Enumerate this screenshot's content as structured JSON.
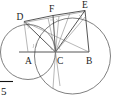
{
  "figure": {
    "kind": "geometry-diagram",
    "background_color": "#ffffff",
    "line_color": "#2b2b2b",
    "circle_color": "#555555",
    "label_color": "#1a1a1a",
    "points": [
      {
        "id": "A",
        "label": "A",
        "x": 28,
        "y": 52,
        "label_x": 25,
        "label_y": 64
      },
      {
        "id": "B",
        "label": "B",
        "x": 89,
        "y": 52,
        "label_x": 86,
        "label_y": 64
      },
      {
        "id": "C",
        "label": "C",
        "x": 55.5,
        "y": 52,
        "label_x": 57,
        "label_y": 64
      },
      {
        "id": "D",
        "label": "D",
        "x": 24,
        "y": 21.5,
        "label_x": 17,
        "label_y": 20
      },
      {
        "id": "E",
        "label": "E",
        "x": 85,
        "y": 10.5,
        "label_x": 83,
        "label_y": 8
      },
      {
        "id": "F",
        "label": "F",
        "x": 53,
        "y": 15.5,
        "label_x": 49,
        "label_y": 12
      }
    ],
    "circles": [
      {
        "id": "circle-A",
        "center_label": "A",
        "cx": 28,
        "cy": 52,
        "r": 27.5
      },
      {
        "id": "circle-B",
        "center_label": "B",
        "cx": 72.5,
        "cy": 56,
        "r": 38
      }
    ],
    "segments": [
      {
        "id": "seg-AB",
        "from": "A",
        "to": "B"
      },
      {
        "id": "seg-AD",
        "from": "A",
        "to": "D"
      },
      {
        "id": "seg-DC",
        "from": "D",
        "to": "C"
      },
      {
        "id": "seg-DF",
        "from": "D",
        "to": "F"
      },
      {
        "id": "seg-DE",
        "from": "D",
        "to": "E"
      },
      {
        "id": "seg-FC",
        "from": "F",
        "to": "C"
      },
      {
        "id": "seg-FE",
        "from": "F",
        "to": "E"
      },
      {
        "id": "seg-CE",
        "from": "C",
        "to": "E"
      },
      {
        "id": "seg-EB",
        "from": "E",
        "to": "B"
      },
      {
        "id": "seg-DB",
        "from": "D",
        "to": "B"
      }
    ],
    "angle_marks_count": 8
  },
  "annotation": {
    "radical_symbol": "√",
    "radicand": "5",
    "caption": "√5"
  }
}
